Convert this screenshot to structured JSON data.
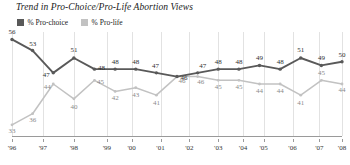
{
  "chart": {
    "title": "Trend in Pro-Choice/Pro-Life Abortion Views",
    "legend": [
      {
        "label": "% Pro-choice",
        "color": "#595959",
        "swatch_name": "legend-swatch-pro-choice"
      },
      {
        "label": "% Pro-life",
        "color": "#c2c2c2",
        "swatch_name": "legend-swatch-pro-life"
      }
    ]
  },
  "chart_data": {
    "type": "line",
    "title": "Trend in Pro-Choice/Pro-Life Abortion Views",
    "xlabel": "",
    "ylabel": "",
    "ylim": [
      30,
      58
    ],
    "xlim": [
      0,
      16
    ],
    "grid": "vertical",
    "legend_position": "top-left",
    "x": [
      0,
      1,
      2,
      3,
      4,
      5,
      6,
      7,
      8,
      9,
      10,
      11,
      12,
      13,
      14,
      15,
      16
    ],
    "categories": [
      "'96",
      "'97",
      "'97b",
      "'98",
      "'98b",
      "'99",
      "'00",
      "'01",
      "'01b",
      "'02",
      "'03",
      "'04",
      "'05",
      "'06a",
      "'06",
      "'07",
      "'08"
    ],
    "tick_labels": [
      "'96",
      "'97",
      "'98",
      "'99",
      "'00",
      "'01",
      "'02",
      "'03",
      "'04",
      "'05",
      "'06",
      "'07",
      "'08"
    ],
    "tick_positions": [
      0,
      1.5,
      3,
      4.6,
      5.8,
      7.2,
      8.6,
      10.0,
      11.2,
      12.2,
      13.6,
      14.9,
      16.0
    ],
    "series": [
      {
        "name": "% Pro-choice",
        "color": "#595959",
        "values": [
          56,
          53,
          47,
          51,
          48,
          48,
          48,
          47,
          46,
          47,
          48,
          48,
          49,
          48,
          51,
          49,
          50
        ]
      },
      {
        "name": "% Pro-life",
        "color": "#c2c2c2",
        "values": [
          33,
          36,
          44,
          40,
          45,
          42,
          43,
          41,
          46,
          46,
          45,
          45,
          44,
          44,
          41,
          45,
          44
        ]
      }
    ],
    "labels": {
      "pro_choice": [
        "56",
        "53",
        "47",
        "51",
        "48",
        "48",
        "48",
        "47",
        "46",
        "47",
        "48",
        "48",
        "49",
        "48",
        "51",
        "49",
        "50"
      ],
      "pro_life": [
        "33",
        "36",
        "44",
        "40",
        "45",
        "42",
        "43",
        "41",
        "46",
        "46",
        "45",
        "45",
        "44",
        "44",
        "41",
        "45",
        "44"
      ]
    }
  }
}
